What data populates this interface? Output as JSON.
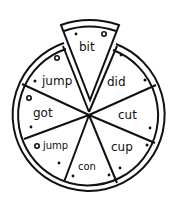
{
  "diagram": {
    "type": "pizza-word-wheel",
    "slices": [
      {
        "position": "top-removed",
        "word": "bit"
      },
      {
        "position": "upper-right",
        "word": "did"
      },
      {
        "position": "right",
        "word": "cut"
      },
      {
        "position": "lower-right",
        "word": "cup"
      },
      {
        "position": "bottom",
        "word": "con"
      },
      {
        "position": "lower-left",
        "word": "jump"
      },
      {
        "position": "left",
        "word": "got"
      },
      {
        "position": "upper-left",
        "word": "jump"
      }
    ],
    "colors": {
      "stroke": "#111111",
      "background": "#ffffff"
    }
  }
}
